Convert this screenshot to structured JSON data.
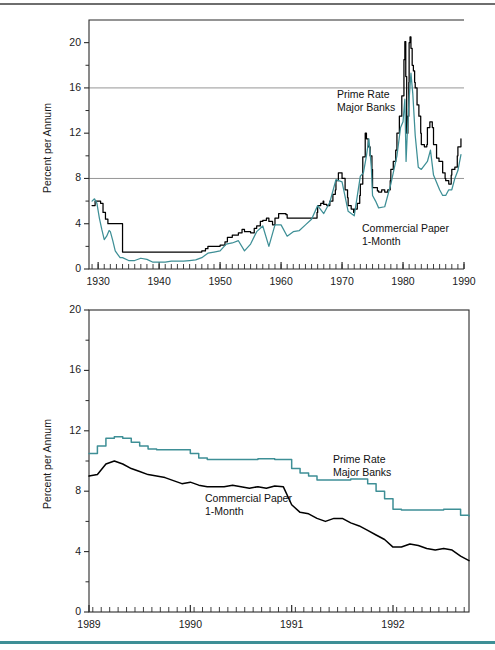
{
  "figure": {
    "rule_top_color": "#6e6e6e",
    "rule_bottom_color": "#3e8f96",
    "background": "#ffffff"
  },
  "series_colors": {
    "prime_rate": "#000000",
    "commercial_paper": "#3e8f96"
  },
  "chart_data": [
    {
      "id": "top",
      "type": "line",
      "title": "",
      "xlabel": "",
      "ylabel": "Percent per Annum",
      "xlim": [
        1928.5,
        1990
      ],
      "ylim": [
        0,
        22
      ],
      "yticks": [
        0,
        4,
        8,
        12,
        16,
        20
      ],
      "ytick_labels": [
        "0",
        "4",
        "8",
        "12",
        "16",
        "20"
      ],
      "yminor": [
        2,
        6,
        10,
        14,
        18
      ],
      "xticks": [
        1930,
        1940,
        1950,
        1960,
        1970,
        1980,
        1990
      ],
      "xtick_labels": [
        "1930",
        "1940",
        "1950",
        "1960",
        "1970",
        "1980",
        "1990"
      ],
      "xminor_step": 1,
      "gridlines": [
        8,
        16
      ],
      "grid": "horizontal-major-only",
      "legend": "inline-annotations",
      "annotations": [
        {
          "name": "prime-rate-label",
          "text_line1": "Prime Rate",
          "text_line2": "Major Banks",
          "x": 337,
          "y": 88
        },
        {
          "name": "commercial-paper-label",
          "text_line1": "Commercial Paper",
          "text_line2": "1-Month",
          "x": 362,
          "y": 222
        }
      ],
      "series": [
        {
          "name": "Prime Rate Major Banks",
          "color": "#000000",
          "x": [
            1929.0,
            1929.5,
            1930.0,
            1930.4,
            1930.8,
            1931.2,
            1931.6,
            1932.0,
            1932.5,
            1933.0,
            1933.5,
            1934.0,
            1934.5,
            1935,
            1936,
            1937,
            1938,
            1939,
            1940,
            1941,
            1942,
            1943,
            1944,
            1945,
            1946,
            1947.0,
            1947.6,
            1948.0,
            1948.6,
            1949,
            1950.0,
            1950.8,
            1951.2,
            1952,
            1953.0,
            1953.6,
            1954,
            1955.0,
            1955.6,
            1956.0,
            1956.6,
            1957.0,
            1957.6,
            1958.0,
            1958.6,
            1959.0,
            1959.6,
            1960.0,
            1960.8,
            1961,
            1962,
            1963,
            1964,
            1965.0,
            1965.9,
            1966.0,
            1966.5,
            1966.9,
            1967.0,
            1967.5,
            1967.9,
            1968.0,
            1968.5,
            1968.9,
            1969.0,
            1969.4,
            1969.7,
            1970.0,
            1970.5,
            1970.9,
            1971.0,
            1971.5,
            1971.9,
            1972.0,
            1972.5,
            1972.9,
            1973.0,
            1973.4,
            1973.8,
            1974.0,
            1974.3,
            1974.6,
            1974.9,
            1975.0,
            1975.4,
            1975.8,
            1976.0,
            1976.5,
            1976.9,
            1977.0,
            1977.5,
            1977.9,
            1978.0,
            1978.4,
            1978.8,
            1979.0,
            1979.4,
            1979.8,
            1980.0,
            1980.15,
            1980.3,
            1980.45,
            1980.6,
            1980.8,
            1980.95,
            1981.0,
            1981.15,
            1981.3,
            1981.5,
            1981.7,
            1981.9,
            1982.0,
            1982.3,
            1982.6,
            1982.9,
            1983.0,
            1983.5,
            1983.9,
            1984.0,
            1984.4,
            1984.8,
            1985.0,
            1985.5,
            1985.9,
            1986.0,
            1986.5,
            1986.9,
            1987.0,
            1987.5,
            1987.9,
            1988.0,
            1988.5,
            1988.9,
            1989.0,
            1989.5
          ],
          "y": [
            5.6,
            6.0,
            6.0,
            5.8,
            5.0,
            4.4,
            4.0,
            4.0,
            4.0,
            4.0,
            4.0,
            1.5,
            1.5,
            1.5,
            1.5,
            1.5,
            1.5,
            1.5,
            1.5,
            1.5,
            1.5,
            1.5,
            1.5,
            1.5,
            1.5,
            1.6,
            1.8,
            2.0,
            2.0,
            2.0,
            2.1,
            2.4,
            2.8,
            3.0,
            3.2,
            3.5,
            3.3,
            3.2,
            3.6,
            3.8,
            4.2,
            4.3,
            4.5,
            4.2,
            3.9,
            4.5,
            4.9,
            4.9,
            4.8,
            4.5,
            4.5,
            4.5,
            4.5,
            4.5,
            5.0,
            5.6,
            5.8,
            6.0,
            5.7,
            5.6,
            5.6,
            6.0,
            6.6,
            7.0,
            7.8,
            8.5,
            8.5,
            8.0,
            7.0,
            6.3,
            5.6,
            5.3,
            5.0,
            5.3,
            5.8,
            6.5,
            7.5,
            9.9,
            12.0,
            11.5,
            10.8,
            10.0,
            8.8,
            7.2,
            7.2,
            6.9,
            6.8,
            7.0,
            7.0,
            6.8,
            7.0,
            7.8,
            8.8,
            9.5,
            10.5,
            12.0,
            13.5,
            15.3,
            15.3,
            18.5,
            20.1,
            17.0,
            12.0,
            13.5,
            16.5,
            20.0,
            20.5,
            19.5,
            18.0,
            17.5,
            16.5,
            16.0,
            14.5,
            13.5,
            12.0,
            11.0,
            10.8,
            11.0,
            12.5,
            13.0,
            12.5,
            11.0,
            9.8,
            9.5,
            9.5,
            8.5,
            8.0,
            7.8,
            7.5,
            8.3,
            8.8,
            9.0,
            10.0,
            10.8,
            11.5,
            11.0
          ],
          "step": true
        },
        {
          "name": "Commercial Paper 1-Month",
          "color": "#3e8f96",
          "x": [
            1929.0,
            1929.4,
            1929.8,
            1930.2,
            1930.6,
            1931.0,
            1931.4,
            1931.8,
            1932.0,
            1932.4,
            1932.8,
            1933.2,
            1933.6,
            1934,
            1935,
            1936,
            1937,
            1938,
            1939,
            1940,
            1941,
            1942,
            1943,
            1944,
            1945,
            1946,
            1947,
            1948,
            1949,
            1950,
            1951,
            1952,
            1953,
            1954,
            1955,
            1956,
            1957,
            1958,
            1959,
            1960,
            1961,
            1962,
            1963,
            1964,
            1965,
            1966,
            1967,
            1968,
            1969,
            1970,
            1971,
            1972,
            1973,
            1973.5,
            1974.0,
            1974.4,
            1974.8,
            1975.0,
            1975.5,
            1976,
            1977,
            1978,
            1979,
            1979.6,
            1980.0,
            1980.3,
            1980.5,
            1980.7,
            1981.0,
            1981.3,
            1981.6,
            1982.0,
            1982.5,
            1983,
            1984,
            1984.5,
            1985,
            1986,
            1986.5,
            1987,
            1987.5,
            1988,
            1988.5,
            1989.0,
            1989.5
          ],
          "y": [
            6.0,
            6.2,
            5.8,
            4.5,
            3.5,
            2.6,
            2.9,
            3.4,
            3.3,
            2.5,
            1.6,
            1.3,
            1.0,
            1.0,
            0.75,
            0.75,
            0.95,
            0.85,
            0.6,
            0.6,
            0.6,
            0.7,
            0.7,
            0.7,
            0.75,
            0.8,
            1.0,
            1.4,
            1.5,
            1.6,
            2.2,
            2.3,
            2.5,
            1.6,
            2.2,
            3.3,
            3.8,
            2.0,
            3.9,
            3.9,
            2.9,
            3.3,
            3.4,
            3.9,
            4.4,
            5.6,
            4.9,
            5.9,
            7.9,
            7.7,
            5.1,
            4.7,
            8.2,
            8.5,
            10.0,
            11.5,
            9.0,
            6.5,
            6.0,
            5.4,
            5.5,
            7.5,
            10.0,
            12.5,
            13.0,
            15.0,
            9.5,
            12.0,
            15.0,
            17.3,
            15.5,
            11.8,
            9.0,
            8.8,
            9.5,
            10.5,
            8.3,
            7.0,
            6.5,
            6.5,
            7.0,
            7.0,
            8.0,
            8.7,
            10.1
          ],
          "step": false
        }
      ]
    },
    {
      "id": "bottom",
      "type": "line",
      "title": "",
      "xlabel": "",
      "ylabel": "Percent per Annum",
      "xlim": [
        1989.0,
        1992.75
      ],
      "ylim": [
        0,
        20
      ],
      "yticks": [
        0,
        4,
        8,
        12,
        16,
        20
      ],
      "ytick_labels": [
        "0",
        "4",
        "8",
        "12",
        "16",
        "20"
      ],
      "yminor": [
        2,
        6,
        10,
        14,
        18
      ],
      "xticks": [
        1989,
        1990,
        1991,
        1992
      ],
      "xtick_labels": [
        "1989",
        "1990",
        "1991",
        "1992"
      ],
      "xminor_step": 0.0833,
      "grid": "none",
      "legend": "inline-annotations",
      "annotations": [
        {
          "name": "prime-rate-label",
          "text_line1": "Prime Rate",
          "text_line2": "Major Banks",
          "x": 333,
          "y": 453
        },
        {
          "name": "commercial-paper-label",
          "text_line1": "Commercial Paper",
          "text_line2": "1-Month",
          "x": 205,
          "y": 492
        }
      ],
      "series": [
        {
          "name": "Prime Rate Major Banks",
          "color": "#3e8f96",
          "x": [
            1989.0,
            1989.083,
            1989.167,
            1989.25,
            1989.333,
            1989.417,
            1989.5,
            1989.583,
            1989.667,
            1989.75,
            1989.833,
            1989.917,
            1990.0,
            1990.083,
            1990.167,
            1990.25,
            1990.333,
            1990.417,
            1990.5,
            1990.583,
            1990.667,
            1990.75,
            1990.833,
            1990.917,
            1991.0,
            1991.083,
            1991.167,
            1991.25,
            1991.333,
            1991.417,
            1991.5,
            1991.583,
            1991.667,
            1991.75,
            1991.833,
            1991.917,
            1992.0,
            1992.083,
            1992.167,
            1992.25,
            1992.333,
            1992.417,
            1992.5,
            1992.583,
            1992.667,
            1992.75
          ],
          "y": [
            10.5,
            11.0,
            11.5,
            11.6,
            11.5,
            11.25,
            11.0,
            10.8,
            10.75,
            10.75,
            10.75,
            10.75,
            10.5,
            10.2,
            10.1,
            10.1,
            10.1,
            10.1,
            10.1,
            10.1,
            10.15,
            10.15,
            10.1,
            10.1,
            9.5,
            9.2,
            9.0,
            8.75,
            8.75,
            8.75,
            8.75,
            8.8,
            8.8,
            8.5,
            8.0,
            7.5,
            6.8,
            6.75,
            6.75,
            6.75,
            6.75,
            6.75,
            6.8,
            6.8,
            6.4,
            6.35
          ],
          "step": true
        },
        {
          "name": "Commercial Paper 1-Month",
          "color": "#000000",
          "x": [
            1989.0,
            1989.083,
            1989.167,
            1989.25,
            1989.333,
            1989.417,
            1989.5,
            1989.583,
            1989.667,
            1989.75,
            1989.833,
            1989.917,
            1990.0,
            1990.083,
            1990.167,
            1990.25,
            1990.333,
            1990.417,
            1990.5,
            1990.583,
            1990.667,
            1990.75,
            1990.833,
            1990.917,
            1991.0,
            1991.083,
            1991.167,
            1991.25,
            1991.333,
            1991.417,
            1991.5,
            1991.583,
            1991.667,
            1991.75,
            1991.833,
            1991.917,
            1992.0,
            1992.083,
            1992.167,
            1992.25,
            1992.333,
            1992.417,
            1992.5,
            1992.583,
            1992.667,
            1992.75
          ],
          "y": [
            9.0,
            9.1,
            9.8,
            10.0,
            9.8,
            9.5,
            9.3,
            9.1,
            9.0,
            8.9,
            8.7,
            8.5,
            8.6,
            8.4,
            8.3,
            8.3,
            8.3,
            8.4,
            8.3,
            8.2,
            8.3,
            8.2,
            8.35,
            8.3,
            7.1,
            6.6,
            6.5,
            6.2,
            6.0,
            6.2,
            6.2,
            5.9,
            5.7,
            5.4,
            5.1,
            4.8,
            4.3,
            4.3,
            4.5,
            4.4,
            4.2,
            4.1,
            4.2,
            4.1,
            3.7,
            3.4
          ],
          "step": false
        }
      ]
    }
  ]
}
